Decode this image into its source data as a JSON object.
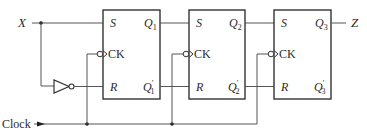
{
  "diagram": {
    "type": "sequential-circuit",
    "inputs": {
      "x": "X",
      "clock": "Clock"
    },
    "output": "Z",
    "flip_flops": [
      {
        "id": "ff1",
        "s": "S",
        "r": "R",
        "ck": "CK",
        "q": "Q",
        "q_sub": "1",
        "qp": "Q",
        "qp_sub": "1",
        "prime": "′"
      },
      {
        "id": "ff2",
        "s": "S",
        "r": "R",
        "ck": "CK",
        "q": "Q",
        "q_sub": "2",
        "qp": "Q",
        "qp_sub": "2",
        "prime": "′"
      },
      {
        "id": "ff3",
        "s": "S",
        "r": "R",
        "ck": "CK",
        "q": "Q",
        "q_sub": "3",
        "qp": "Q",
        "qp_sub": "3",
        "prime": "′"
      }
    ],
    "gates": [
      {
        "type": "inverter",
        "input": "X",
        "output": "R1"
      }
    ],
    "connections": [
      "X -> S1",
      "NOT X -> R1",
      "Q1 -> S2",
      "Q1' -> R2",
      "Q2 -> S3",
      "Q2' -> R3",
      "Q3 -> Z",
      "Clock -> CK1, CK2, CK3 (falling edge)"
    ]
  }
}
